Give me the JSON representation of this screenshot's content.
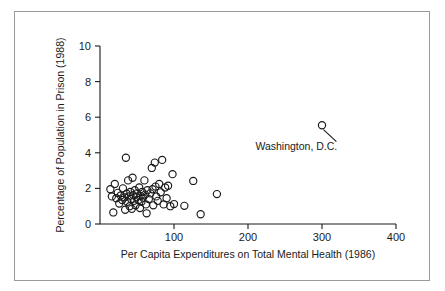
{
  "figure": {
    "background": "#ffffff",
    "border_color": "#9a9a9a",
    "marker_color": "#1a1a1a",
    "axis_color": "#1a1a1a"
  },
  "chart_data": {
    "type": "scatter",
    "title": "",
    "xlabel": "Per Capita Expenditures on Total Mental Health (1986)",
    "ylabel": "Percentage of Population in Prison (1988)",
    "xlim": [
      0,
      400
    ],
    "ylim": [
      0,
      10
    ],
    "xticks": [
      100,
      200,
      300,
      400
    ],
    "xticklabels": [
      "100",
      "200",
      "300",
      "400"
    ],
    "yticks": [
      0,
      2,
      4,
      6,
      8,
      10
    ],
    "yticklabels": [
      "0",
      "2",
      "4",
      "6",
      "8",
      "10"
    ],
    "grid": false,
    "legend": null,
    "marker": "open-circle",
    "points": [
      [
        14,
        1.95
      ],
      [
        16,
        1.55
      ],
      [
        18,
        0.65
      ],
      [
        20,
        2.25
      ],
      [
        22,
        1.45
      ],
      [
        24,
        1.75
      ],
      [
        26,
        1.15
      ],
      [
        28,
        1.6
      ],
      [
        30,
        1.35
      ],
      [
        31,
        2.0
      ],
      [
        33,
        1.5
      ],
      [
        34,
        0.8
      ],
      [
        35,
        3.72
      ],
      [
        36,
        1.7
      ],
      [
        37,
        1.25
      ],
      [
        38,
        2.45
      ],
      [
        39,
        1.55
      ],
      [
        40,
        1.0
      ],
      [
        41,
        1.8
      ],
      [
        42,
        1.4
      ],
      [
        43,
        0.85
      ],
      [
        44,
        2.6
      ],
      [
        45,
        1.62
      ],
      [
        46,
        1.3
      ],
      [
        47,
        1.9
      ],
      [
        48,
        1.05
      ],
      [
        49,
        1.5
      ],
      [
        50,
        1.72
      ],
      [
        52,
        1.35
      ],
      [
        53,
        2.05
      ],
      [
        54,
        0.9
      ],
      [
        55,
        1.58
      ],
      [
        56,
        1.25
      ],
      [
        57,
        1.8
      ],
      [
        58,
        1.48
      ],
      [
        60,
        2.45
      ],
      [
        61,
        1.65
      ],
      [
        62,
        1.1
      ],
      [
        63,
        0.6
      ],
      [
        64,
        1.9
      ],
      [
        66,
        1.4
      ],
      [
        68,
        1.72
      ],
      [
        70,
        3.15
      ],
      [
        71,
        1.95
      ],
      [
        72,
        1.05
      ],
      [
        74,
        3.45
      ],
      [
        75,
        2.1
      ],
      [
        76,
        1.55
      ],
      [
        78,
        1.3
      ],
      [
        80,
        2.25
      ],
      [
        82,
        1.78
      ],
      [
        84,
        3.6
      ],
      [
        86,
        1.1
      ],
      [
        88,
        2.05
      ],
      [
        90,
        1.45
      ],
      [
        92,
        2.15
      ],
      [
        95,
        1.0
      ],
      [
        98,
        2.8
      ],
      [
        100,
        1.12
      ],
      [
        114,
        1.02
      ],
      [
        126,
        2.42
      ],
      [
        136,
        0.55
      ],
      [
        158,
        1.68
      ],
      [
        300,
        5.55
      ]
    ],
    "annotations": [
      {
        "label": "Washington, D.C.",
        "point": [
          300,
          5.55
        ],
        "text_x": 210,
        "text_y": 4.18
      }
    ]
  }
}
